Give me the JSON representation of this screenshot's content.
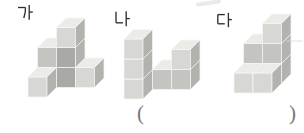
{
  "answer_blank": {
    "open": "(",
    "close": ")"
  },
  "colors": {
    "label": "#2f2f2f",
    "paren": "#767676",
    "face_top": "#ebebe8",
    "face_front_normal": "#d7d7d3",
    "face_front_mid": "#c4c4c0",
    "face_front_dark": "#a9a9a5",
    "face_right": "#b2b2ae",
    "edge": "#f6f6f4"
  },
  "projection": {
    "cube_w": 19,
    "cube_h": 20,
    "depth_dx": 9.5,
    "depth_dy": 9.5
  },
  "figures": [
    {
      "id": "ga",
      "label": "가",
      "label_pos": [
        17,
        4.5
      ],
      "origin": [
        28,
        97
      ],
      "cubes": [
        {
          "p": [
            0,
            1,
            0
          ],
          "front": "dark"
        },
        {
          "p": [
            1,
            1,
            0
          ],
          "front": "dark"
        },
        {
          "p": [
            2,
            1,
            0
          ],
          "front": "normal"
        },
        {
          "p": [
            0,
            1,
            1
          ],
          "front": "mid"
        },
        {
          "p": [
            1,
            1,
            1
          ],
          "front": "dark"
        },
        {
          "p": [
            1,
            1,
            2
          ],
          "front": "normal"
        },
        {
          "p": [
            0,
            0,
            0
          ],
          "front": "normal"
        }
      ]
    },
    {
      "id": "na",
      "label": "나",
      "label_pos": [
        114,
        11
      ],
      "origin": [
        124,
        99
      ],
      "cubes": [
        {
          "p": [
            1,
            1,
            0
          ],
          "front": "mid"
        },
        {
          "p": [
            2,
            1,
            0
          ],
          "front": "mid"
        },
        {
          "p": [
            2,
            1,
            1
          ],
          "front": "normal"
        },
        {
          "p": [
            0,
            0,
            0
          ],
          "front": "normal"
        },
        {
          "p": [
            0,
            0,
            1
          ],
          "front": "normal"
        },
        {
          "p": [
            0,
            0,
            2
          ],
          "front": "normal"
        }
      ]
    },
    {
      "id": "da",
      "label": "다",
      "label_pos": [
        216,
        12
      ],
      "origin": [
        234,
        93
      ],
      "cubes": [
        {
          "p": [
            0,
            1,
            0
          ],
          "front": "dark"
        },
        {
          "p": [
            1,
            1,
            0
          ],
          "front": "dark"
        },
        {
          "p": [
            0,
            1,
            1
          ],
          "front": "mid"
        },
        {
          "p": [
            1,
            1,
            1
          ],
          "front": "mid"
        },
        {
          "p": [
            1,
            1,
            2
          ],
          "front": "normal"
        },
        {
          "p": [
            0,
            0,
            0
          ],
          "front": "normal"
        },
        {
          "p": [
            1,
            0,
            0
          ],
          "front": "normal"
        }
      ]
    }
  ]
}
